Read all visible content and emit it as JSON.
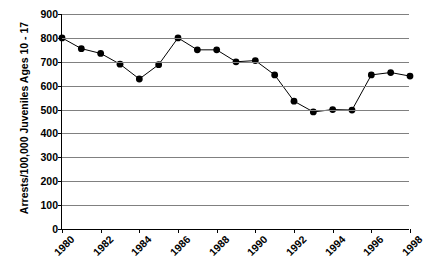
{
  "chart_data": {
    "type": "line",
    "title": "",
    "xlabel": "",
    "ylabel": "Arrests/100,000 Juveniles Ages 10 - 17",
    "ylim": [
      0,
      900
    ],
    "ytick_values": [
      900,
      800,
      700,
      600,
      500,
      400,
      300,
      200,
      100,
      0
    ],
    "ytick_labels": [
      "900",
      "800",
      "700",
      "600",
      "500",
      "400",
      "300",
      "200",
      "100",
      "0"
    ],
    "xlim": [
      1980,
      1998
    ],
    "xtick_values": [
      1980,
      1982,
      1984,
      1986,
      1988,
      1990,
      1992,
      1994,
      1996,
      1998
    ],
    "xtick_labels": [
      "1980",
      "1982",
      "1984",
      "1986",
      "1988",
      "1990",
      "1992",
      "1994",
      "1996",
      "1998"
    ],
    "grid": true,
    "grid_axis": "y",
    "legend": false,
    "x": [
      1980,
      1981,
      1982,
      1983,
      1984,
      1985,
      1986,
      1987,
      1988,
      1989,
      1990,
      1991,
      1992,
      1993,
      1994,
      1995,
      1996,
      1997,
      1998
    ],
    "values": [
      800,
      755,
      735,
      690,
      628,
      688,
      800,
      750,
      750,
      700,
      705,
      645,
      535,
      490,
      500,
      498,
      645,
      655,
      640
    ],
    "series": [
      {
        "name": "Juvenile arrest rate",
        "values": [
          800,
          755,
          735,
          690,
          628,
          688,
          800,
          750,
          750,
          700,
          705,
          645,
          535,
          490,
          500,
          498,
          645,
          655,
          640
        ],
        "line_color": "#000000",
        "marker_color": "#000000",
        "marker": "circle"
      }
    ],
    "colors": {
      "line": "#000000",
      "marker": "#000000",
      "gridline": "#808080",
      "axis": "#000000",
      "background": "#ffffff"
    }
  }
}
